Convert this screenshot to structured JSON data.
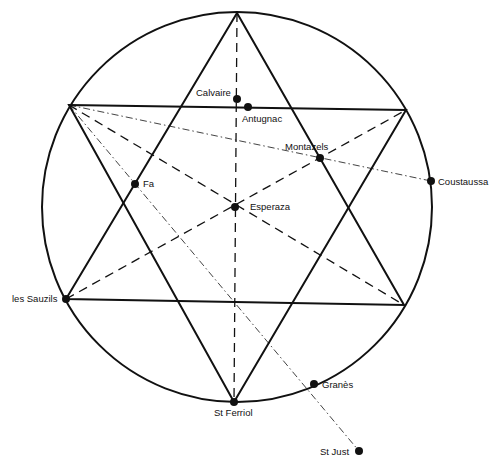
{
  "diagram": {
    "type": "hexagram-in-circle",
    "circle": {
      "cx": 237,
      "cy": 207,
      "r": 195
    },
    "vertices": {
      "top": [
        237,
        13
      ],
      "upper_left": [
        69,
        105
      ],
      "upper_right": [
        406,
        110
      ],
      "lower_left": [
        66,
        299
      ],
      "lower_right": [
        404,
        305
      ],
      "bottom": [
        234,
        402
      ]
    },
    "points": [
      {
        "id": "calvaire",
        "name": "Calvaire",
        "x": 237,
        "y": 99,
        "label_x": 196,
        "label_y": 96,
        "anchor": "start"
      },
      {
        "id": "antugnac",
        "name": "Antugnac",
        "x": 248,
        "y": 107,
        "label_x": 242,
        "label_y": 122,
        "anchor": "start"
      },
      {
        "id": "montazels",
        "name": "Montazels",
        "x": 320,
        "y": 158,
        "label_x": 285,
        "label_y": 150,
        "anchor": "start"
      },
      {
        "id": "coustaussa",
        "name": "Coustaussa",
        "x": 431,
        "y": 181,
        "label_x": 438,
        "label_y": 185,
        "anchor": "start"
      },
      {
        "id": "fa",
        "name": "Fa",
        "x": 135,
        "y": 184,
        "label_x": 143,
        "label_y": 187,
        "anchor": "start"
      },
      {
        "id": "esperaza",
        "name": "Esperaza",
        "x": 235,
        "y": 207,
        "label_x": 250,
        "label_y": 210,
        "anchor": "start"
      },
      {
        "id": "les-sauzils",
        "name": "les Sauzils",
        "x": 66,
        "y": 299,
        "label_x": 12,
        "label_y": 302,
        "anchor": "start"
      },
      {
        "id": "st-ferriol",
        "name": "St Ferriol",
        "x": 234,
        "y": 402,
        "label_x": 214,
        "label_y": 416,
        "anchor": "start"
      },
      {
        "id": "granes",
        "name": "Granès",
        "x": 314,
        "y": 384,
        "label_x": 322,
        "label_y": 388,
        "anchor": "start"
      },
      {
        "id": "st-just",
        "name": "St Just",
        "x": 359,
        "y": 451,
        "label_x": 320,
        "label_y": 455,
        "anchor": "start"
      }
    ],
    "style": {
      "stroke_color": "#111111",
      "background": "#ffffff",
      "solid_width": 2,
      "dashed_width": 1.3,
      "dashdot_width": 0.8
    },
    "line_types": {
      "solid": "hexagram triangles and circle",
      "dashed": "axes through Esperaza",
      "dash_dot": "alignments from upper-left vertex"
    }
  }
}
